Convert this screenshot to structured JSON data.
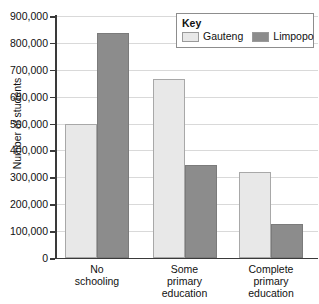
{
  "chart_data": {
    "type": "bar",
    "title": "",
    "xlabel": "",
    "ylabel": "Number of students",
    "categories": [
      "No\nschooling",
      "Some\nprimary\neducation",
      "Complete\nprimary\neducation"
    ],
    "series": [
      {
        "name": "Gauteng",
        "color": "#e8e8e8",
        "values": [
          500000,
          665000,
          320000
        ]
      },
      {
        "name": "Limpopo",
        "color": "#8c8c8c",
        "values": [
          835000,
          345000,
          128000
        ]
      }
    ],
    "ylim": [
      0,
      900000
    ],
    "ytick_step": 100000,
    "ytick_labels": [
      "0",
      "100,000",
      "200,000",
      "300,000",
      "400,000",
      "500,000",
      "600,000",
      "700,000",
      "800,000",
      "900,000"
    ],
    "grid": true,
    "legend_position": "top-right"
  },
  "legend": {
    "title": "Key"
  }
}
